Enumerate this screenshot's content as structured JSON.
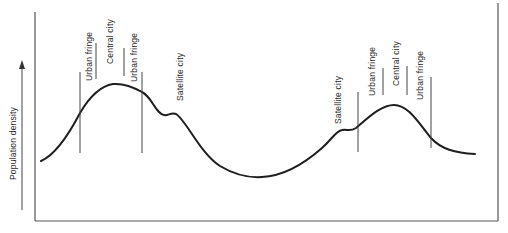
{
  "diagram": {
    "type": "population-density-profile",
    "y_axis_label": "Population density",
    "colors": {
      "curve": "#1e1e1e",
      "axes": "#555555",
      "text": "#2a2a2a",
      "background": "#ffffff"
    },
    "left_city": {
      "labels": [
        "Urban fringe",
        "Central city",
        "Urban fringe",
        "Satellite city"
      ]
    },
    "right_city": {
      "labels": [
        "Satellite city",
        "Urban fringe",
        "Central city",
        "Urban fringe"
      ]
    }
  }
}
